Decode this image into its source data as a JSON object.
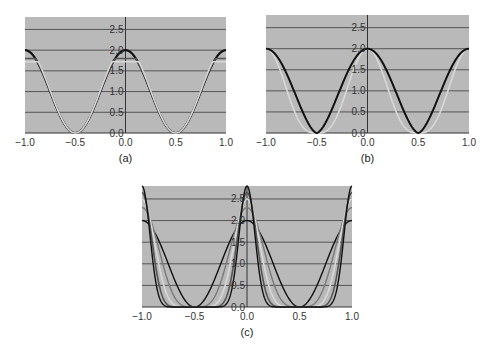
{
  "colors": {
    "plot_bg": "#b9b9b9",
    "grid": "#555555",
    "axis": "#333333",
    "series_black": "#111111",
    "series_dark": "#555555",
    "series_mid": "#7a7a7a",
    "series_light": "#d8d8d8"
  },
  "chart_data": [
    {
      "id": "a",
      "caption": "(a)",
      "type": "line",
      "xlim": [
        -1.0,
        1.0
      ],
      "ylim": [
        0.0,
        2.8
      ],
      "xticks": [
        "-1.0",
        "-0.5",
        "0.0",
        "0.5",
        "1.0"
      ],
      "yticks": [
        "0.0",
        "0.5",
        "1.0",
        "1.5",
        "2.0",
        "2.5"
      ],
      "grid": true,
      "box": {
        "x0": 25,
        "y0": 17,
        "x1": 226,
        "y1": 133
      },
      "series": [
        {
          "name": "black",
          "kind": "cos",
          "peak": 2.0,
          "power": 1,
          "color": "series_black",
          "width": 2.2
        },
        {
          "name": "dark",
          "kind": "trunc",
          "peak": 1.8,
          "power": 1,
          "color": "series_dark",
          "width": 1.6
        },
        {
          "name": "light",
          "kind": "trunc2",
          "peak": 1.72,
          "power": 1,
          "color": "series_light",
          "width": 1.6
        }
      ]
    },
    {
      "id": "b",
      "caption": "(b)",
      "type": "line",
      "xlim": [
        -1.0,
        1.0
      ],
      "ylim": [
        0.0,
        2.8
      ],
      "xticks": [
        "-1.0",
        "-0.5",
        "0.0",
        "0.5",
        "1.0"
      ],
      "yticks": [
        "0.0",
        "0.5",
        "1.0",
        "1.5",
        "2.0",
        "2.5"
      ],
      "grid": true,
      "box": {
        "x0": 266,
        "y0": 15,
        "x1": 469,
        "y1": 133
      },
      "series": [
        {
          "name": "light",
          "kind": "abscos",
          "peak": 2.0,
          "power": 3,
          "color": "series_light",
          "width": 1.6
        },
        {
          "name": "black",
          "kind": "abscos",
          "peak": 2.0,
          "power": 1.6,
          "color": "series_black",
          "width": 2.0
        }
      ]
    },
    {
      "id": "c",
      "caption": "(c)",
      "type": "line",
      "xlim": [
        -1.0,
        1.0
      ],
      "ylim": [
        0.0,
        2.8
      ],
      "xticks": [
        "-1.0",
        "-0.5",
        "0.0",
        "0.5",
        "1.0"
      ],
      "yticks": [
        "0.0",
        "0.5",
        "1.0",
        "1.5",
        "2.0",
        "2.5"
      ],
      "grid": true,
      "box": {
        "x0": 142,
        "y0": 186,
        "x1": 352,
        "y1": 307
      },
      "series": [
        {
          "name": "n1",
          "kind": "powcos",
          "peak": 2.0,
          "power": 2,
          "color": "series_black",
          "width": 1.4
        },
        {
          "name": "n2",
          "kind": "powcos",
          "peak": 2.3,
          "power": 4,
          "color": "series_mid",
          "width": 1.4
        },
        {
          "name": "n3",
          "kind": "powcos",
          "peak": 2.5,
          "power": 7,
          "color": "series_light",
          "width": 1.6
        },
        {
          "name": "n4",
          "kind": "powcos",
          "peak": 2.65,
          "power": 12,
          "color": "series_dark",
          "width": 1.6
        },
        {
          "name": "n5",
          "kind": "powcos",
          "peak": 2.8,
          "power": 18,
          "color": "series_black",
          "width": 1.4
        }
      ]
    }
  ]
}
